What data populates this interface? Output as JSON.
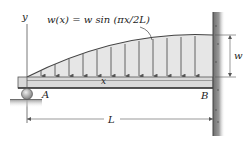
{
  "diagram": {
    "type": "beam-loading",
    "load_equation": "w(x) = w sin (πx/2L)",
    "labels": {
      "y_axis": "y",
      "x_axis": "x",
      "support_left": "A",
      "support_right": "B",
      "load_magnitude": "w",
      "span_length": "L"
    },
    "supports": {
      "left": "roller",
      "right": "fixed-wall"
    },
    "colors": {
      "beam_fill": "#d9d9d9",
      "beam_stroke": "#555555",
      "load_fill": "#e6e6e6",
      "arrow": "#555555",
      "wall": "#8a8a8a",
      "line": "#333333"
    }
  }
}
